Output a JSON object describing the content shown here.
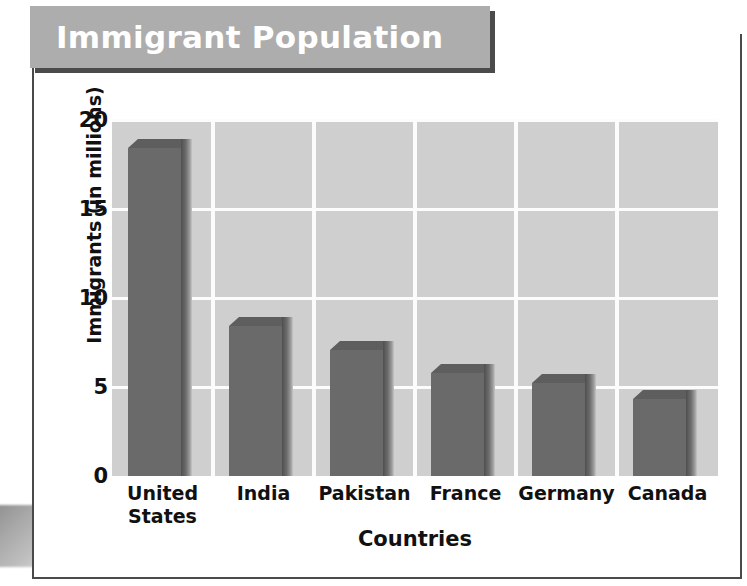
{
  "title": "Immigrant Population",
  "chart_data": {
    "type": "bar",
    "title": "Immigrant Population",
    "xlabel": "Countries",
    "ylabel": "Immigrants (in millions)",
    "categories": [
      "United States",
      "India",
      "Pakistan",
      "France",
      "Germany",
      "Canada"
    ],
    "category_lines": [
      [
        "United",
        "States"
      ],
      [
        "India"
      ],
      [
        "Pakistan"
      ],
      [
        "France"
      ],
      [
        "Germany"
      ],
      [
        "Canada"
      ]
    ],
    "values": [
      18.4,
      8.4,
      7.1,
      5.8,
      5.2,
      4.3
    ],
    "ylim": [
      0,
      20
    ],
    "yticks": [
      0,
      5,
      10,
      15,
      20
    ],
    "ytick_labels": [
      "0",
      "5",
      "10",
      "15",
      "20"
    ],
    "grid": true,
    "legend": "none",
    "bar_color": "#6a6a6a",
    "plot_background": "#cfcfcf",
    "gridline_color": "#fcfcfc"
  },
  "colors": {
    "banner_background": "#adadad",
    "banner_text": "#ffffff",
    "banner_shadow": "#4b4b4b",
    "frame_border": "#4a4a4a",
    "axis_text": "#111111"
  }
}
